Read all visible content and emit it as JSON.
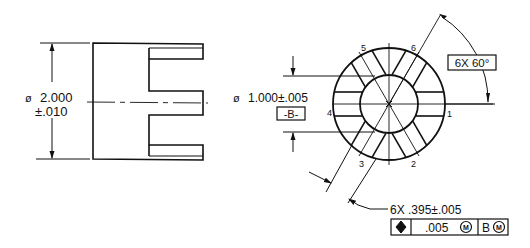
{
  "drawing": {
    "side_view": {
      "diameter_symbol": "ø",
      "diameter_value": "2.000",
      "diameter_tolerance": "±.010"
    },
    "end_view": {
      "bore_symbol": "ø",
      "bore_value": "1.000±.005",
      "datum_label": "-B-",
      "angle_callout": "6X 60°",
      "slot_callout": "6X .395±.005",
      "slot_numbers": [
        "1",
        "2",
        "3",
        "4",
        "5",
        "6"
      ],
      "feature_control_frame": {
        "symbol": "position-icon",
        "tolerance": ".005",
        "tolerance_modifier": "M",
        "datum": "B",
        "datum_modifier": "M"
      }
    }
  }
}
